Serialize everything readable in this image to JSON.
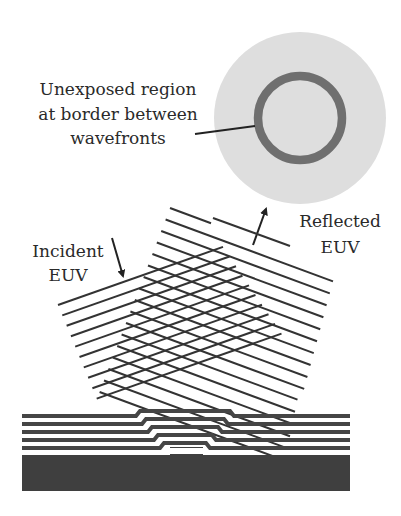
{
  "diagram": {
    "labels": {
      "unexposed": [
        "Unexposed region",
        "at border between",
        "wavefronts"
      ],
      "incident": [
        "Incident",
        "EUV"
      ],
      "reflected": [
        "Reflected",
        "EUV"
      ]
    },
    "colors": {
      "background": "#ffffff",
      "spot_fill": "#dedede",
      "ring": "#6f6f6f",
      "wavefront": "#333333",
      "layer": "#454545",
      "substrate": "#3f3f3f",
      "text": "#2a2a2a"
    },
    "multilayer": {
      "layer_count": 5,
      "has_defect_bump": true
    },
    "wavefronts": {
      "incident_line_count": 10,
      "reflected_line_count": 17
    }
  }
}
